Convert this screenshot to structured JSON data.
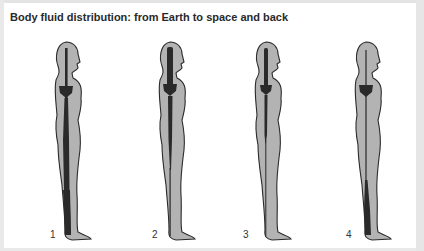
{
  "title": "Body fluid distribution: from Earth to space and back",
  "colors": {
    "body_fill": "#b3b3b3",
    "body_outline": "#2b2b2b",
    "fluid": "#2a2a2a",
    "background": "#ffffff"
  },
  "figures": [
    {
      "label": "1",
      "state": "on-earth-fluid-pooled-in-legs"
    },
    {
      "label": "2",
      "state": "early-spaceflight-fluid-shift-to-head"
    },
    {
      "label": "3",
      "state": "adapted-to-space-reduced-volume"
    },
    {
      "label": "4",
      "state": "return-to-earth-fluid-in-legs"
    }
  ]
}
